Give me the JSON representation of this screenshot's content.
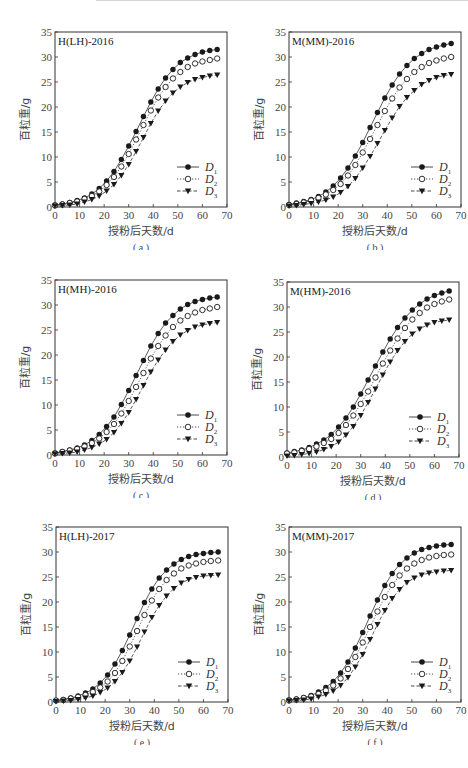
{
  "chart_data": [
    {
      "type": "line",
      "panel": "a",
      "title": "H(LH)-2016",
      "caption": "( a )",
      "xlabel": "授粉后天数/d",
      "ylabel": "百粒重/g",
      "xlim": [
        0,
        70
      ],
      "ylim": [
        0,
        35
      ],
      "xticks": [
        0,
        10,
        20,
        30,
        40,
        50,
        60,
        70
      ],
      "yticks": [
        0,
        5,
        10,
        15,
        20,
        25,
        30,
        35
      ],
      "grid": false,
      "legend_position": "lower right",
      "x": [
        0,
        3,
        6,
        9,
        12,
        15,
        18,
        21,
        24,
        27,
        30,
        33,
        36,
        39,
        42,
        45,
        48,
        51,
        54,
        57,
        60,
        63,
        66
      ],
      "series": [
        {
          "name": "D1",
          "marker": "filled-circle",
          "line": "solid",
          "values": [
            0.4,
            0.6,
            0.9,
            1.3,
            1.8,
            2.6,
            3.7,
            5.2,
            7.1,
            9.5,
            12.2,
            15.1,
            18.1,
            21.0,
            23.6,
            25.8,
            27.5,
            28.9,
            29.8,
            30.5,
            31.0,
            31.3,
            31.5
          ]
        },
        {
          "name": "D2",
          "marker": "open-circle",
          "line": "dotted",
          "values": [
            0.3,
            0.5,
            0.8,
            1.1,
            1.6,
            2.2,
            3.1,
            4.4,
            6.0,
            8.1,
            10.6,
            13.5,
            16.4,
            19.3,
            21.9,
            24.0,
            25.7,
            27.0,
            28.0,
            28.7,
            29.1,
            29.4,
            29.7
          ]
        },
        {
          "name": "D3",
          "marker": "filled-triangle-down",
          "line": "dashed",
          "values": [
            0.2,
            0.3,
            0.4,
            0.6,
            1.0,
            1.5,
            2.2,
            3.2,
            4.5,
            6.3,
            8.5,
            11.1,
            13.9,
            16.7,
            19.2,
            21.2,
            22.8,
            24.0,
            24.9,
            25.5,
            25.9,
            26.2,
            26.4
          ]
        }
      ]
    },
    {
      "type": "line",
      "panel": "b",
      "title": "M(MM)-2016",
      "caption": "( b )",
      "xlabel": "授粉后天数/d",
      "ylabel": "百粒重/g",
      "xlim": [
        0,
        70
      ],
      "ylim": [
        0,
        35
      ],
      "xticks": [
        0,
        10,
        20,
        30,
        40,
        50,
        60,
        70
      ],
      "yticks": [
        0,
        5,
        10,
        15,
        20,
        25,
        30,
        35
      ],
      "grid": false,
      "legend_position": "lower right",
      "x": [
        0,
        3,
        6,
        9,
        12,
        15,
        18,
        21,
        24,
        27,
        30,
        33,
        36,
        39,
        42,
        45,
        48,
        51,
        54,
        57,
        60,
        63,
        66
      ],
      "series": [
        {
          "name": "D1",
          "marker": "filled-circle",
          "line": "solid",
          "values": [
            0.5,
            0.8,
            1.1,
            1.5,
            2.1,
            3.0,
            4.2,
            5.8,
            7.8,
            10.2,
            12.9,
            15.9,
            18.9,
            21.8,
            24.4,
            26.6,
            28.3,
            29.7,
            30.7,
            31.5,
            32.0,
            32.4,
            32.7
          ]
        },
        {
          "name": "D2",
          "marker": "open-circle",
          "line": "dotted",
          "values": [
            0.4,
            0.6,
            0.9,
            1.3,
            1.8,
            2.5,
            3.4,
            4.6,
            6.3,
            8.4,
            10.9,
            13.6,
            16.4,
            19.2,
            21.7,
            23.9,
            25.6,
            27.0,
            28.0,
            28.8,
            29.3,
            29.7,
            30.0
          ]
        },
        {
          "name": "D3",
          "marker": "filled-triangle-down",
          "line": "dashed",
          "values": [
            0.2,
            0.3,
            0.5,
            0.7,
            1.0,
            1.4,
            2.0,
            2.9,
            4.1,
            5.7,
            7.8,
            10.1,
            12.7,
            15.3,
            17.8,
            20.1,
            21.9,
            23.3,
            24.5,
            25.3,
            25.9,
            26.3,
            26.5
          ]
        }
      ]
    },
    {
      "type": "line",
      "panel": "c",
      "title": "H(MH)-2016",
      "caption": "( c )",
      "xlabel": "授粉后天数/d",
      "ylabel": "百粒重/g",
      "xlim": [
        0,
        70
      ],
      "ylim": [
        0,
        35
      ],
      "xticks": [
        0,
        10,
        20,
        30,
        40,
        50,
        60,
        70
      ],
      "yticks": [
        0,
        5,
        10,
        15,
        20,
        25,
        30,
        35
      ],
      "grid": false,
      "legend_position": "lower right",
      "x": [
        0,
        3,
        6,
        9,
        12,
        15,
        18,
        21,
        24,
        27,
        30,
        33,
        36,
        39,
        42,
        45,
        48,
        51,
        54,
        57,
        60,
        63,
        66
      ],
      "series": [
        {
          "name": "D1",
          "marker": "filled-circle",
          "line": "solid",
          "values": [
            0.4,
            0.7,
            1.0,
            1.4,
            2.0,
            2.9,
            4.1,
            5.7,
            7.6,
            10.1,
            12.9,
            15.9,
            18.9,
            21.8,
            24.3,
            26.4,
            27.9,
            29.2,
            30.1,
            30.7,
            31.1,
            31.4,
            31.6
          ]
        },
        {
          "name": "D2",
          "marker": "open-circle",
          "line": "dotted",
          "values": [
            0.3,
            0.6,
            0.9,
            1.2,
            1.7,
            2.4,
            3.3,
            4.6,
            6.2,
            8.3,
            10.8,
            13.6,
            16.4,
            19.3,
            21.8,
            23.9,
            25.6,
            26.9,
            27.8,
            28.5,
            29.0,
            29.3,
            29.6
          ]
        },
        {
          "name": "D3",
          "marker": "filled-triangle-down",
          "line": "dashed",
          "values": [
            0.2,
            0.3,
            0.4,
            0.6,
            1.0,
            1.5,
            2.2,
            3.1,
            4.5,
            6.3,
            8.5,
            11.1,
            13.9,
            16.6,
            19.0,
            21.0,
            22.7,
            24.0,
            24.9,
            25.6,
            26.0,
            26.3,
            26.5
          ]
        }
      ]
    },
    {
      "type": "line",
      "panel": "d",
      "title": "M(HM)-2016",
      "caption": "( d )",
      "xlabel": "授粉后天数/d",
      "ylabel": "百粒重/g",
      "xlim": [
        0,
        70
      ],
      "ylim": [
        0,
        35
      ],
      "xticks": [
        0,
        10,
        20,
        30,
        40,
        50,
        60,
        70
      ],
      "yticks": [
        0,
        5,
        10,
        15,
        20,
        25,
        30,
        35
      ],
      "grid": false,
      "legend_position": "lower right",
      "x": [
        0,
        3,
        6,
        9,
        12,
        15,
        18,
        21,
        24,
        27,
        30,
        33,
        36,
        39,
        42,
        45,
        48,
        51,
        54,
        57,
        60,
        63,
        66
      ],
      "series": [
        {
          "name": "D1",
          "marker": "filled-circle",
          "line": "solid",
          "values": [
            0.8,
            1.1,
            1.4,
            1.9,
            2.6,
            3.4,
            4.5,
            6.0,
            7.8,
            10.0,
            12.6,
            15.4,
            18.2,
            21.0,
            23.6,
            25.9,
            27.8,
            29.4,
            30.6,
            31.6,
            32.3,
            32.8,
            33.2
          ]
        },
        {
          "name": "D2",
          "marker": "open-circle",
          "line": "dotted",
          "values": [
            0.7,
            0.9,
            1.2,
            1.6,
            2.1,
            2.8,
            3.6,
            4.8,
            6.4,
            8.3,
            10.6,
            13.1,
            15.9,
            18.7,
            21.3,
            23.7,
            25.8,
            27.5,
            28.8,
            29.9,
            30.6,
            31.1,
            31.5
          ]
        },
        {
          "name": "D3",
          "marker": "filled-triangle-down",
          "line": "dashed",
          "values": [
            0.2,
            0.3,
            0.5,
            0.7,
            1.0,
            1.5,
            2.1,
            3.0,
            4.4,
            6.1,
            8.3,
            10.9,
            13.6,
            16.4,
            19.0,
            21.3,
            23.1,
            24.6,
            25.6,
            26.4,
            26.9,
            27.2,
            27.4
          ]
        }
      ]
    },
    {
      "type": "line",
      "panel": "e",
      "title": "H(LH)-2017",
      "caption": "( e )",
      "xlabel": "授粉后天数/d",
      "ylabel": "百粒重/g",
      "xlim": [
        0,
        70
      ],
      "ylim": [
        0,
        35
      ],
      "xticks": [
        0,
        10,
        20,
        30,
        40,
        50,
        60,
        70
      ],
      "yticks": [
        0,
        5,
        10,
        15,
        20,
        25,
        30,
        35
      ],
      "grid": false,
      "legend_position": "lower right",
      "x": [
        0,
        3,
        6,
        9,
        12,
        15,
        18,
        21,
        24,
        27,
        30,
        33,
        36,
        39,
        42,
        45,
        48,
        51,
        54,
        57,
        60,
        63,
        66
      ],
      "series": [
        {
          "name": "D1",
          "marker": "filled-circle",
          "line": "solid",
          "values": [
            0.3,
            0.5,
            0.8,
            1.2,
            1.8,
            2.6,
            3.8,
            5.4,
            7.6,
            10.3,
            13.4,
            16.7,
            19.9,
            22.6,
            24.8,
            26.4,
            27.6,
            28.5,
            29.1,
            29.5,
            29.7,
            29.9,
            30.0
          ]
        },
        {
          "name": "D2",
          "marker": "open-circle",
          "line": "dotted",
          "values": [
            0.3,
            0.4,
            0.7,
            1.0,
            1.4,
            2.0,
            2.9,
            4.1,
            5.8,
            8.2,
            11.1,
            14.2,
            17.4,
            20.3,
            22.6,
            24.4,
            25.7,
            26.7,
            27.3,
            27.7,
            28.0,
            28.2,
            28.3
          ]
        },
        {
          "name": "D3",
          "marker": "filled-triangle-down",
          "line": "dashed",
          "values": [
            0.1,
            0.2,
            0.3,
            0.5,
            0.8,
            1.2,
            1.9,
            2.8,
            4.1,
            5.9,
            8.2,
            11.0,
            14.0,
            16.9,
            19.3,
            21.2,
            22.7,
            23.8,
            24.5,
            24.9,
            25.2,
            25.3,
            25.4
          ]
        }
      ]
    },
    {
      "type": "line",
      "panel": "f",
      "title": "M(MM)-2017",
      "caption": "( f )",
      "xlabel": "授粉后天数/d",
      "ylabel": "百粒重/g",
      "xlim": [
        0,
        70
      ],
      "ylim": [
        0,
        35
      ],
      "xticks": [
        0,
        10,
        20,
        30,
        40,
        50,
        60,
        70
      ],
      "yticks": [
        0,
        5,
        10,
        15,
        20,
        25,
        30,
        35
      ],
      "grid": false,
      "legend_position": "lower right",
      "x": [
        0,
        3,
        6,
        9,
        12,
        15,
        18,
        21,
        24,
        27,
        30,
        33,
        36,
        39,
        42,
        45,
        48,
        51,
        54,
        57,
        60,
        63,
        66
      ],
      "series": [
        {
          "name": "D1",
          "marker": "filled-circle",
          "line": "solid",
          "values": [
            0.4,
            0.6,
            0.9,
            1.3,
            2.0,
            2.9,
            4.1,
            5.8,
            8.0,
            10.8,
            13.9,
            17.2,
            20.4,
            23.3,
            25.7,
            27.5,
            28.8,
            29.8,
            30.5,
            30.9,
            31.2,
            31.4,
            31.5
          ]
        },
        {
          "name": "D2",
          "marker": "open-circle",
          "line": "dotted",
          "values": [
            0.3,
            0.5,
            0.8,
            1.1,
            1.6,
            2.3,
            3.3,
            4.7,
            6.6,
            9.0,
            11.9,
            15.0,
            18.1,
            21.0,
            23.4,
            25.3,
            26.7,
            27.7,
            28.4,
            28.9,
            29.2,
            29.4,
            29.5
          ]
        },
        {
          "name": "D3",
          "marker": "filled-triangle-down",
          "line": "dashed",
          "values": [
            0.2,
            0.3,
            0.4,
            0.6,
            1.0,
            1.5,
            2.2,
            3.3,
            4.9,
            7.0,
            9.5,
            12.5,
            15.5,
            18.3,
            20.7,
            22.5,
            23.9,
            24.8,
            25.4,
            25.8,
            26.0,
            26.2,
            26.3
          ]
        }
      ]
    }
  ],
  "legend": {
    "labels": [
      {
        "base": "D",
        "sub": "1"
      },
      {
        "base": "D",
        "sub": "2"
      },
      {
        "base": "D",
        "sub": "3"
      }
    ]
  },
  "colors": {
    "axis": "#333333",
    "line": "#333333",
    "marker": "#1a1a1a",
    "text": "#444444",
    "background": "#ffffff"
  }
}
